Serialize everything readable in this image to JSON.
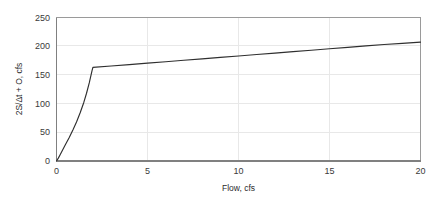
{
  "chart_data": {
    "type": "line",
    "title": "",
    "xlabel": "Flow, cfs",
    "ylabel": "2S/Δt + O, cfs",
    "xlim": [
      0,
      20
    ],
    "ylim": [
      0,
      250
    ],
    "xticks": [
      0,
      5,
      10,
      15,
      20
    ],
    "yticks": [
      0,
      50,
      100,
      150,
      200,
      250
    ],
    "xtick_labels": [
      "0",
      "5",
      "10",
      "15",
      "20"
    ],
    "ytick_labels": [
      "0",
      "50",
      "100",
      "150",
      "200",
      "250"
    ],
    "grid": true,
    "grid_axis": "both",
    "legend": false,
    "legend_position": "none",
    "line_color": "#2f2f2f",
    "grid_color": "#e8e8e8",
    "frame_color": "#9a9a9a",
    "series": [
      {
        "name": "Storage indication curve",
        "x": [
          0.0,
          0.1,
          0.2,
          0.35,
          0.5,
          0.7,
          0.9,
          1.1,
          1.3,
          1.5,
          1.65,
          1.8,
          1.9,
          1.95,
          2.0,
          3.0,
          4.0,
          5.0,
          6.0,
          7.0,
          8.0,
          9.0,
          10.0,
          11.0,
          12.0,
          13.0,
          14.0,
          15.0,
          16.0,
          17.0,
          18.0,
          19.0,
          20.0
        ],
        "y": [
          0.0,
          5.0,
          11.0,
          20.0,
          29.0,
          41.0,
          54.0,
          68.0,
          84.0,
          102.0,
          118.0,
          136.0,
          150.0,
          157.0,
          163.0,
          165.5,
          168.0,
          170.5,
          173.0,
          175.5,
          178.0,
          180.5,
          183.0,
          185.5,
          188.0,
          190.5,
          193.0,
          195.5,
          198.0,
          200.5,
          203.0,
          205.0,
          207.0
        ]
      }
    ],
    "annotations": {
      "knee_point": {
        "x": 2.0,
        "y": 163.0
      }
    }
  }
}
